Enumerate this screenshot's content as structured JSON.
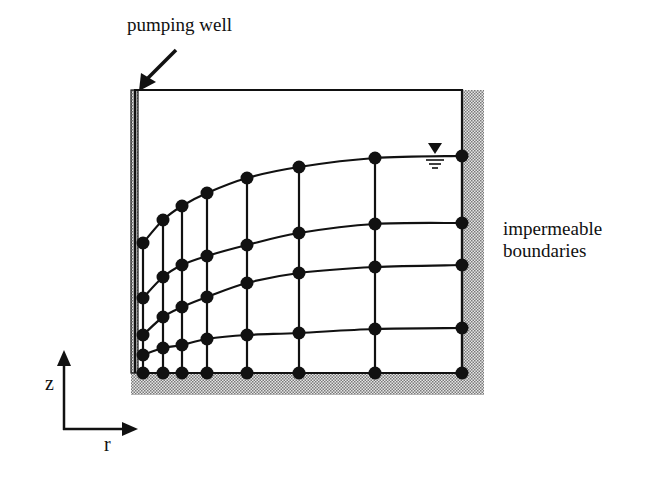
{
  "labels": {
    "pumping_well": "pumping well",
    "impermeable_boundaries_line1": "impermeable",
    "impermeable_boundaries_line2": "boundaries",
    "axis_z": "z",
    "axis_r": "r"
  },
  "diagram": {
    "type": "finite-element mesh (radial flow to pumping well)",
    "domain_box": {
      "left": 135,
      "top": 90,
      "right": 462,
      "bottom": 373
    },
    "boundaries": {
      "well_left": {
        "x": 131,
        "width": 7,
        "style": "hatched"
      },
      "right": {
        "x": 462,
        "width": 22,
        "style": "hatched"
      },
      "bottom": {
        "y": 373,
        "height": 22,
        "style": "hatched"
      }
    },
    "columns_x": [
      143,
      163,
      182,
      207,
      247,
      299,
      375,
      462
    ],
    "rows": [
      {
        "name": "water-table",
        "y": [
          243,
          220,
          206,
          193,
          178,
          167,
          158,
          156
        ]
      },
      {
        "name": "row-2",
        "y": [
          298,
          277,
          265,
          256,
          245,
          233,
          224,
          223
        ]
      },
      {
        "name": "row-3",
        "y": [
          335,
          317,
          307,
          297,
          283,
          273,
          267,
          265
        ]
      },
      {
        "name": "row-4",
        "y": [
          355,
          348,
          345,
          339,
          335,
          333,
          329,
          328
        ]
      },
      {
        "name": "bottom",
        "y": [
          373,
          373,
          373,
          373,
          373,
          373,
          373,
          373
        ]
      }
    ],
    "node_radius": 6.5,
    "water_table_symbol": {
      "x": 435,
      "y": 156
    },
    "colors": {
      "ink": "#111111",
      "hatch": "#9a9a9a",
      "background": "#ffffff"
    }
  }
}
